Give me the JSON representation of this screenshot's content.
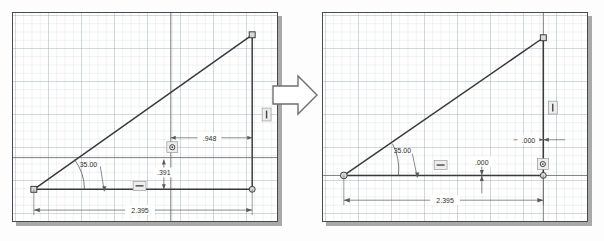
{
  "scene": {
    "title": "CAD sketch dimension edit before and after",
    "transition_icon": "right-arrow-icon",
    "colors": {
      "geometry_line": "#3a3a3a",
      "dimension_line": "#5a5a5a",
      "grid_line": "#96a5b4",
      "panel_border": "#4a4a4a",
      "panel_shadow": "#a9a9a9",
      "text": "#2d2d2d",
      "background": "#ffffff"
    }
  },
  "panels": [
    {
      "id": "before",
      "name": "before-panel",
      "geometry": {
        "shape": "right-triangle",
        "vertices": [
          "origin-point",
          "top-right-point",
          "bottom-right-point"
        ],
        "angle_vertex": "origin-point"
      },
      "dimensions": [
        {
          "name": "angle-dimension",
          "value": "35.00",
          "kind": "angular"
        },
        {
          "name": "horizontal-offset-dimension",
          "value": ".948",
          "kind": "linear-horizontal"
        },
        {
          "name": "vertical-offset-dimension",
          "value": ".391",
          "kind": "linear-vertical"
        },
        {
          "name": "overall-length-dimension",
          "value": "2.395",
          "kind": "linear-horizontal"
        }
      ],
      "constraints": [
        {
          "name": "horizontal-constraint-icon",
          "glyph": "horizontal"
        },
        {
          "name": "vertical-constraint-icon",
          "glyph": "vertical"
        },
        {
          "name": "coincident-constraint-icon",
          "glyph": "coincident"
        }
      ]
    },
    {
      "id": "after",
      "name": "after-panel",
      "geometry": {
        "shape": "right-triangle",
        "vertices": [
          "origin-point",
          "top-right-point",
          "bottom-right-point"
        ],
        "angle_vertex": "origin-point"
      },
      "dimensions": [
        {
          "name": "angle-dimension",
          "value": "35.00",
          "kind": "angular"
        },
        {
          "name": "horizontal-offset-dimension",
          "value": ".000",
          "kind": "linear-horizontal"
        },
        {
          "name": "vertical-offset-dimension",
          "value": ".000",
          "kind": "linear-vertical"
        },
        {
          "name": "overall-length-dimension",
          "value": "2.395",
          "kind": "linear-horizontal"
        }
      ],
      "constraints": [
        {
          "name": "horizontal-constraint-icon",
          "glyph": "horizontal"
        },
        {
          "name": "vertical-constraint-icon",
          "glyph": "vertical"
        },
        {
          "name": "coincident-constraint-icon",
          "glyph": "coincident"
        }
      ]
    }
  ]
}
